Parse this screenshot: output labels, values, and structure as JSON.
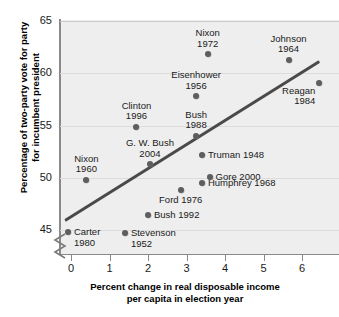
{
  "chart_data": {
    "type": "scatter",
    "title": "",
    "xlabel": "Percent change in real disposable income per capita in election year",
    "ylabel": "Percentage of two-party vote for party for incumbent president",
    "xlabel_lines": [
      "Percent change in real disposable income",
      "per capita in election year"
    ],
    "ylabel_lines": [
      "Percentage of two-party vote for party",
      "for incumbent president"
    ],
    "xlim": [
      -0.35,
      6.9
    ],
    "ylim": [
      43.6,
      65
    ],
    "xticks": [
      0,
      1,
      2,
      3,
      4,
      5,
      6
    ],
    "xtick_labels": [
      "0",
      "1",
      "2",
      "3",
      "4",
      "5",
      "6"
    ],
    "yticks": [
      45,
      50,
      55,
      60,
      65
    ],
    "ytick_labels": [
      "45",
      "50",
      "55",
      "60",
      "65"
    ],
    "grid": "horizontal",
    "y_axis_break": true,
    "legend": "none",
    "plot_bg": "#eeeeee",
    "point_color": "#5e5e5e",
    "trendline_color": "#4a4a4a",
    "trendline": {
      "x0": -0.15,
      "y0": 46.1,
      "x1": 6.45,
      "y1": 61.3
    },
    "points": [
      {
        "label": "Nixon 1972",
        "label_lines": [
          "Nixon",
          "1972"
        ],
        "x": 3.55,
        "y": 61.8,
        "pos": "above-center"
      },
      {
        "label": "Johnson 1964",
        "label_lines": [
          "Johnson",
          "1964"
        ],
        "x": 5.65,
        "y": 61.3,
        "pos": "above-center"
      },
      {
        "label": "Reagan 1984",
        "label_lines": [
          "Reagan",
          "1984"
        ],
        "x": 6.45,
        "y": 59.1,
        "pos": "below-left"
      },
      {
        "label": "Eisenhower 1956",
        "label_lines": [
          "Eisenhower",
          "1956"
        ],
        "x": 3.25,
        "y": 57.8,
        "pos": "above-center"
      },
      {
        "label": "Clinton 1996",
        "label_lines": [
          "Clinton",
          "1996"
        ],
        "x": 1.7,
        "y": 54.9,
        "pos": "above-center"
      },
      {
        "label": "Bush 1988",
        "label_lines": [
          "Bush",
          "1988"
        ],
        "x": 3.25,
        "y": 54.0,
        "pos": "above-center"
      },
      {
        "label": "G. W. Bush 2004",
        "label_lines": [
          "G. W. Bush",
          "2004"
        ],
        "x": 2.05,
        "y": 51.3,
        "pos": "above-center"
      },
      {
        "label": "Truman 1948",
        "label_lines": [
          "Truman 1948"
        ],
        "x": 3.4,
        "y": 52.2,
        "pos": "right"
      },
      {
        "label": "Nixon 1960",
        "label_lines": [
          "Nixon",
          "1960"
        ],
        "x": 0.4,
        "y": 49.8,
        "pos": "above-center"
      },
      {
        "label": "Gore 2000",
        "label_lines": [
          "Gore 2000"
        ],
        "x": 3.6,
        "y": 50.1,
        "pos": "right"
      },
      {
        "label": "Humphrey 1968",
        "label_lines": [
          "Humphrey 1968"
        ],
        "x": 3.4,
        "y": 49.5,
        "pos": "right"
      },
      {
        "label": "Ford 1976",
        "label_lines": [
          "Ford 1976"
        ],
        "x": 2.85,
        "y": 48.8,
        "pos": "below-center"
      },
      {
        "label": "Bush 1992",
        "label_lines": [
          "Bush 1992"
        ],
        "x": 2.0,
        "y": 46.4,
        "pos": "right"
      },
      {
        "label": "Carter 1980",
        "label_lines": [
          "Carter",
          "1980"
        ],
        "x": -0.08,
        "y": 44.8,
        "pos": "right-two-line"
      },
      {
        "label": "Stevenson 1952",
        "label_lines": [
          "Stevenson",
          "1952"
        ],
        "x": 1.4,
        "y": 44.7,
        "pos": "right-two-line"
      }
    ]
  }
}
